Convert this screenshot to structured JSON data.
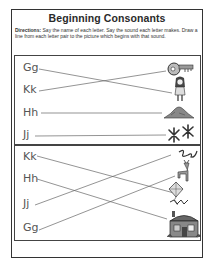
{
  "worksheet": {
    "title": "Beginning Consonants",
    "directions_label": "Directions:",
    "directions_text": " Say the name of each letter. Say the sound each letter makes. Draw a line from each letter pair to the picture which begins with that sound.",
    "section1": {
      "letters": [
        "Gg",
        "Kk",
        "Hh",
        "Jj"
      ],
      "pictures": [
        "key",
        "girl",
        "hill",
        "jacks"
      ],
      "matches": [
        [
          "Gg",
          "girl"
        ],
        [
          "Kk",
          "key"
        ],
        [
          "Hh",
          "hill"
        ],
        [
          "Jj",
          "jacks"
        ]
      ]
    },
    "section2": {
      "letters": [
        "Kk",
        "Hh",
        "Jj",
        "Gg"
      ],
      "pictures": [
        "jump-rope",
        "goat",
        "kite",
        "house"
      ],
      "matches": [
        [
          "Kk",
          "kite"
        ],
        [
          "Hh",
          "house"
        ],
        [
          "Jj",
          "jump-rope"
        ],
        [
          "Gg",
          "goat"
        ]
      ]
    }
  }
}
